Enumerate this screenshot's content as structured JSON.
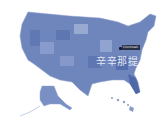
{
  "map": {
    "title": "United States",
    "fill_color": "#6f86bd",
    "fill_dark": "#4f69a8",
    "fill_light": "#a9b8dc",
    "regions": [
      "Contiguous United States",
      "Alaska",
      "Hawaii"
    ]
  },
  "marker": {
    "label": "Cincinnati",
    "color": "#2a2f45"
  },
  "watermark": {
    "text": "辛辛那提"
  }
}
